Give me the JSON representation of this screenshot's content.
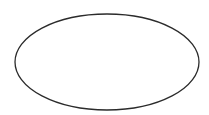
{
  "canvas": {
    "width": 209,
    "height": 115,
    "background": "#ffffff"
  },
  "shapes": [
    {
      "type": "ellipse",
      "cx": 107,
      "cy": 62,
      "rx": 92,
      "ry": 48,
      "stroke": "#2b2b2b",
      "stroke_width": 1.3,
      "fill": "none"
    }
  ]
}
